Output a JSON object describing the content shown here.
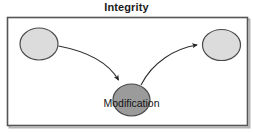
{
  "figure": {
    "title": "Integrity",
    "frame": {
      "border_color": "#555555",
      "fill_color": "#ffffff",
      "shadow_color": "#b4b4b4"
    },
    "background_color": "#ffffff"
  },
  "diagram": {
    "type": "node-link",
    "nodes": [
      {
        "id": "source",
        "label": "",
        "shape": "ellipse",
        "fill": "#dcdcdc",
        "stroke": "#4a4a4a",
        "cx": 39,
        "cy": 44,
        "rx": 19,
        "ry": 16
      },
      {
        "id": "modification",
        "label": "Modification",
        "shape": "ellipse",
        "fill": "#9b9b9b",
        "stroke": "#4a4a4a",
        "cx": 131.5,
        "cy": 100,
        "rx": 18.5,
        "ry": 16,
        "label_x": 131.5,
        "label_y": 107
      },
      {
        "id": "destination",
        "label": "",
        "shape": "ellipse",
        "fill": "#dcdcdc",
        "stroke": "#4a4a4a",
        "cx": 221.5,
        "cy": 45,
        "rx": 19,
        "ry": 15.5
      }
    ],
    "edges": [
      {
        "id": "source-to-modification",
        "from": "source",
        "to": "modification",
        "arrowhead": true,
        "stroke": "#303030",
        "path": "M 58.5 46 C 85 51 108 62 118.5 81"
      },
      {
        "id": "modification-to-destination",
        "from": "modification",
        "to": "destination",
        "arrowhead": true,
        "stroke": "#303030",
        "path": "M 141 85 C 152 63 175 49 198 45"
      }
    ]
  }
}
